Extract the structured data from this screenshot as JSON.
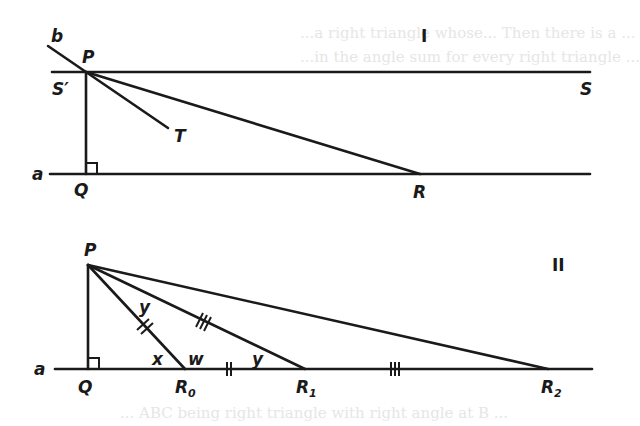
{
  "figure_I": {
    "numeral": "I",
    "labels": {
      "b": "b",
      "P": "P",
      "S_prime": "S′",
      "S": "S",
      "T": "T",
      "a": "a",
      "Q": "Q",
      "R": "R"
    }
  },
  "figure_II": {
    "numeral": "II",
    "labels": {
      "P": "P",
      "a": "a",
      "Q": "Q",
      "R0": "R",
      "R0_sub": "0",
      "R1": "R",
      "R1_sub": "1",
      "R2": "R",
      "R2_sub": "2",
      "angle_y_top": "y",
      "angle_y_bottom": "y",
      "angle_x": "x",
      "angle_w": "w"
    },
    "tick_marks": {
      "PR0": "double",
      "R0R1": "double",
      "PR1": "triple",
      "R1R2": "triple"
    }
  },
  "background_bleed_text": {
    "top_line1": "...a right triangle whose... Then there is a ...",
    "top_line2": "...in the angle sum for every right triangle ...",
    "bottom_line1": "... ABC being right triangle with right angle at B ..."
  }
}
